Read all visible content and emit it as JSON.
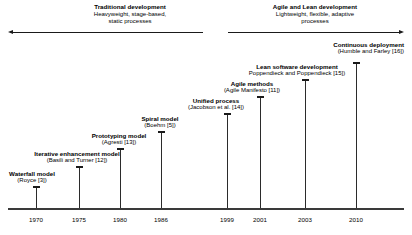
{
  "figure": {
    "eras": [
      {
        "name": "traditional",
        "title": "Traditional development",
        "sub_line1": "Heavyweight, stage-based,",
        "sub_line2": "static processes"
      },
      {
        "name": "agile-lean",
        "title": "Agile and Lean development",
        "sub_line1": "Lightweight, flexible, adaptive",
        "sub_line2": "processes"
      }
    ],
    "axis": {
      "ticks": [
        {
          "label": "1970",
          "x": 36
        },
        {
          "label": "1975",
          "x": 79
        },
        {
          "label": "1980",
          "x": 120
        },
        {
          "label": "1986",
          "x": 161
        },
        {
          "label": "1999",
          "x": 227
        },
        {
          "label": "2001",
          "x": 260
        },
        {
          "label": "2003",
          "x": 305
        },
        {
          "label": "2010",
          "x": 356
        }
      ]
    },
    "events": [
      {
        "name": "waterfall-model",
        "title": "Waterfall model",
        "cite": "(Royce [3])",
        "x": 36,
        "stem_top": 186,
        "label_x": 32,
        "label_y": 170,
        "align": "center"
      },
      {
        "name": "iterative-enhancement-model",
        "title": "Iterative enhancement model",
        "cite": "(Basili and Turner [12])",
        "x": 79,
        "stem_top": 166,
        "label_x": 77,
        "label_y": 150,
        "align": "center"
      },
      {
        "name": "prototyping-model",
        "title": "Prototyping model",
        "cite": "(Agresti [13])",
        "x": 120,
        "stem_top": 148,
        "label_x": 119,
        "label_y": 132,
        "align": "center"
      },
      {
        "name": "spiral-model",
        "title": "Spiral model",
        "cite": "(Boehm [5])",
        "x": 161,
        "stem_top": 131,
        "label_x": 160,
        "label_y": 115,
        "align": "center"
      },
      {
        "name": "unified-process",
        "title": "Unified process",
        "cite": "(Jacobson et al. [14])",
        "x": 227,
        "stem_top": 113,
        "label_x": 216,
        "label_y": 97,
        "align": "center"
      },
      {
        "name": "agile-methods",
        "title": "Agile methods",
        "cite": "(Agile Manifesto [11])",
        "x": 260,
        "stem_top": 96,
        "label_x": 252,
        "label_y": 80,
        "align": "center"
      },
      {
        "name": "lean-software-development",
        "title": "Lean software development",
        "cite": "Poppendieck and Poppendieck [15])",
        "x": 305,
        "stem_top": 79,
        "label_x": 297,
        "label_y": 63,
        "align": "center"
      },
      {
        "name": "continuous-deployment",
        "title": "Continuous deployment",
        "cite": "(Humble and Farley [16])",
        "x": 356,
        "stem_top": 62,
        "label_x": 404,
        "label_y": 41,
        "align": "right"
      }
    ]
  }
}
